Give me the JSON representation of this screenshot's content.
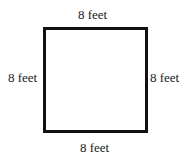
{
  "diagram": {
    "shape": "square",
    "border_color": "#111111",
    "labels": {
      "top": "8 feet",
      "left": "8 feet",
      "right": "8 feet",
      "bottom": "8 feet"
    }
  }
}
